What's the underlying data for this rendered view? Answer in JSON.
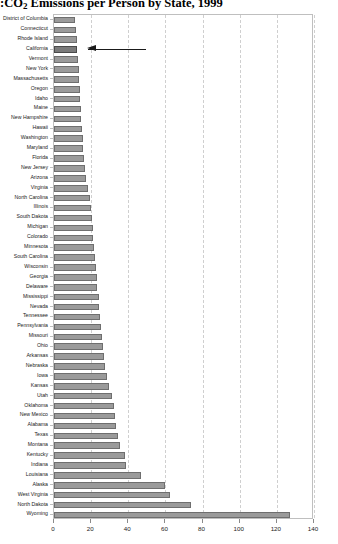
{
  "figure": {
    "title_prefix": ":",
    "title_main_a": "CO",
    "title_sub": "2",
    "title_main_b": " Emissions per Person by State, 1999"
  },
  "annotation": {
    "target_label": "California",
    "marker": "arrow-left",
    "color": "#1a1a1a"
  },
  "colors": {
    "bar_fill": "#9a9a9a",
    "bar_stroke": "#6e6e6e",
    "bar_fill_highlight": "#7a7a7a",
    "bar_stroke_highlight": "#4a4a4a",
    "grid": "#cfcfcf",
    "frame": "#bfbfbf",
    "text": "#1a1a1a"
  },
  "chart_data": {
    "type": "bar",
    "orientation": "horizontal",
    "xlabel": "",
    "ylabel": "",
    "xlim": [
      0,
      140
    ],
    "ylim": null,
    "grid": "vertical-dashed",
    "legend": null,
    "xticks": [
      0,
      20,
      40,
      60,
      80,
      100,
      120,
      140
    ],
    "xticklabels": [
      "0",
      "20",
      "40",
      "60",
      "80",
      "100",
      "120",
      "140"
    ],
    "highlight_category": "California",
    "categories": [
      "District of Columbia",
      "Connecticut",
      "Rhode Island",
      "California",
      "Vermont",
      "New York",
      "Massachusetts",
      "Oregon",
      "Idaho",
      "Maine",
      "New Hampshire",
      "Hawaii",
      "Washington",
      "Maryland",
      "Florida",
      "New Jersey",
      "Arizona",
      "Virginia",
      "North Carolina",
      "Illinois",
      "South Dakota",
      "Michigan",
      "Colorado",
      "Minnesota",
      "South Carolina",
      "Wisconsin",
      "Georgia",
      "Delaware",
      "Mississippi",
      "Nevada",
      "Tennessee",
      "Pennsylvania",
      "Missouri",
      "Ohio",
      "Arkansas",
      "Nebraska",
      "Iowa",
      "Kansas",
      "Utah",
      "Oklahoma",
      "New Mexico",
      "Alabama",
      "Texas",
      "Montana",
      "Kentucky",
      "Indiana",
      "Louisiana",
      "Alaska",
      "West Virginia",
      "North Dakota",
      "Wyoming"
    ],
    "values": [
      11.5,
      12.0,
      12.2,
      12.4,
      12.7,
      13.2,
      13.6,
      14.0,
      14.2,
      14.4,
      14.6,
      15.0,
      15.4,
      15.8,
      16.2,
      16.6,
      17.4,
      18.2,
      19.2,
      19.8,
      20.4,
      20.8,
      21.2,
      21.6,
      22.2,
      22.6,
      23.0,
      23.4,
      24.0,
      24.4,
      24.8,
      25.2,
      25.8,
      26.4,
      27.0,
      27.6,
      28.4,
      29.6,
      31.0,
      32.2,
      33.0,
      33.6,
      34.4,
      35.4,
      38.4,
      39.0,
      47.0,
      59.6,
      62.6,
      73.8,
      127.0
    ]
  }
}
